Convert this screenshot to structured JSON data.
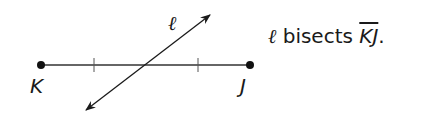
{
  "diagram": {
    "points": [
      {
        "label": "K",
        "x": 41,
        "y": 65
      },
      {
        "label": "J",
        "x": 250,
        "y": 65
      }
    ],
    "line_label": "ℓ",
    "tick_marks": [
      {
        "x": 94,
        "y": 65
      },
      {
        "x": 198,
        "y": 65
      }
    ],
    "intersection": {
      "x": 145,
      "y": 65
    },
    "line_endpoints": {
      "start": {
        "x": 84,
        "y": 112
      },
      "end": {
        "x": 211,
        "y": 14
      }
    }
  },
  "statement": {
    "line": "ℓ",
    "verb": " bisects ",
    "segment": "KJ",
    "end": "."
  }
}
